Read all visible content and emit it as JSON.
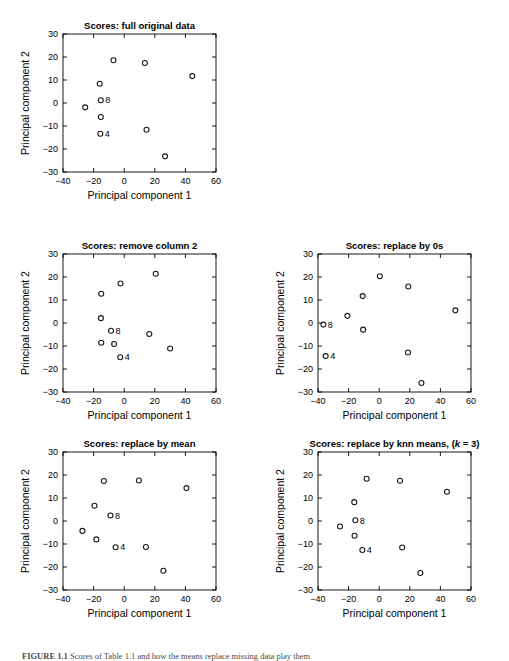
{
  "figure": {
    "background": "#ffffff",
    "marker_color": "#1a1a1a",
    "text_color": "#000000"
  },
  "axis_common": {
    "xlabel": "Principal component 1",
    "ylabel": "Principal component 2",
    "xlim": [
      -40,
      60
    ],
    "ylim": [
      -30,
      30
    ],
    "xticks": [
      -40,
      -20,
      0,
      20,
      40,
      60
    ],
    "yticks": [
      -30,
      -20,
      -10,
      0,
      10,
      20,
      30
    ],
    "xtick_labels": [
      "-40",
      "-20",
      "0",
      "20",
      "40",
      "60"
    ],
    "ytick_labels": [
      "-30",
      "-20",
      "-10",
      "0",
      "10",
      "20",
      "30"
    ],
    "grid": false,
    "legend": "none",
    "marker": "circle-open"
  },
  "caption": {
    "label": "FIGURE 1.1",
    "text": "Scores of Table 1.1 and how the means replace missing data play them"
  },
  "chart_data": [
    {
      "id": "full-original-data",
      "type": "scatter",
      "title": "Scores: full original data",
      "xlabel": "Principal component 1",
      "ylabel": "Principal component 2",
      "xlim": [
        -40,
        60
      ],
      "ylim": [
        -30,
        30
      ],
      "grid": false,
      "legend": "none",
      "points": [
        {
          "x": -25.5,
          "y": -1.9,
          "label": ""
        },
        {
          "x": -16.0,
          "y": 8.4,
          "label": ""
        },
        {
          "x": -15.3,
          "y": 1.2,
          "label": "8"
        },
        {
          "x": -15.3,
          "y": -6.1,
          "label": ""
        },
        {
          "x": -15.6,
          "y": -13.4,
          "label": "4"
        },
        {
          "x": -7.0,
          "y": 18.6,
          "label": ""
        },
        {
          "x": 13.5,
          "y": 17.4,
          "label": ""
        },
        {
          "x": 14.6,
          "y": -11.6,
          "label": ""
        },
        {
          "x": 26.7,
          "y": -23.2,
          "label": ""
        },
        {
          "x": 44.5,
          "y": 11.7,
          "label": ""
        }
      ]
    },
    {
      "id": "remove-column-2",
      "type": "scatter",
      "title": "Scores: remove column 2",
      "xlabel": "Principal component 1",
      "ylabel": "Principal component 2",
      "xlim": [
        -40,
        60
      ],
      "ylim": [
        -30,
        30
      ],
      "grid": false,
      "legend": "none",
      "points": [
        {
          "x": -15.0,
          "y": 12.7,
          "label": ""
        },
        {
          "x": -15.2,
          "y": 2.1,
          "label": ""
        },
        {
          "x": -15.0,
          "y": -8.6,
          "label": ""
        },
        {
          "x": -8.6,
          "y": -3.4,
          "label": "8"
        },
        {
          "x": -6.6,
          "y": -9.1,
          "label": ""
        },
        {
          "x": -2.4,
          "y": 17.2,
          "label": ""
        },
        {
          "x": -2.6,
          "y": -14.9,
          "label": "4"
        },
        {
          "x": 16.4,
          "y": -4.8,
          "label": ""
        },
        {
          "x": 20.6,
          "y": 21.4,
          "label": ""
        },
        {
          "x": 30.0,
          "y": -11.1,
          "label": ""
        }
      ]
    },
    {
      "id": "replace-by-0s",
      "type": "scatter",
      "title": "Scores: replace by 0s",
      "xlabel": "Principal component 1",
      "ylabel": "Principal component 2",
      "xlim": [
        -40,
        60
      ],
      "ylim": [
        -30,
        30
      ],
      "grid": false,
      "legend": "none",
      "points": [
        {
          "x": -36.5,
          "y": -0.7,
          "label": "8"
        },
        {
          "x": -35.0,
          "y": -14.4,
          "label": "4"
        },
        {
          "x": -20.8,
          "y": 3.1,
          "label": ""
        },
        {
          "x": -10.8,
          "y": 11.7,
          "label": ""
        },
        {
          "x": -10.5,
          "y": -2.9,
          "label": ""
        },
        {
          "x": 0.4,
          "y": 20.3,
          "label": ""
        },
        {
          "x": 19.0,
          "y": 15.9,
          "label": ""
        },
        {
          "x": 18.8,
          "y": -12.8,
          "label": ""
        },
        {
          "x": 27.6,
          "y": -26.1,
          "label": ""
        },
        {
          "x": 49.8,
          "y": 5.5,
          "label": ""
        }
      ]
    },
    {
      "id": "replace-by-mean",
      "type": "scatter",
      "title": "Scores: replace by mean",
      "xlabel": "Principal component 1",
      "ylabel": "Principal component 2",
      "xlim": [
        -40,
        60
      ],
      "ylim": [
        -30,
        30
      ],
      "grid": false,
      "legend": "none",
      "points": [
        {
          "x": -27.3,
          "y": -4.3,
          "label": ""
        },
        {
          "x": -19.4,
          "y": 6.6,
          "label": ""
        },
        {
          "x": -18.2,
          "y": -8.0,
          "label": ""
        },
        {
          "x": -13.3,
          "y": 17.4,
          "label": ""
        },
        {
          "x": -9.0,
          "y": 2.4,
          "label": "8"
        },
        {
          "x": -5.6,
          "y": -11.4,
          "label": "4"
        },
        {
          "x": 9.6,
          "y": 17.6,
          "label": ""
        },
        {
          "x": 14.2,
          "y": -11.3,
          "label": ""
        },
        {
          "x": 25.6,
          "y": -21.6,
          "label": ""
        },
        {
          "x": 40.7,
          "y": 14.3,
          "label": ""
        }
      ]
    },
    {
      "id": "replace-by-knn-means",
      "type": "scatter",
      "title_prefix": "Scores: replace by knn means, (",
      "title_italic": "k",
      "title_suffix": " = 3)",
      "title": "Scores: replace by knn means, (k = 3)",
      "xlabel": "Principal component 1",
      "ylabel": "Principal component 2",
      "xlim": [
        -40,
        60
      ],
      "ylim": [
        -30,
        30
      ],
      "grid": false,
      "legend": "none",
      "points": [
        {
          "x": -25.6,
          "y": -2.4,
          "label": ""
        },
        {
          "x": -16.3,
          "y": 8.2,
          "label": ""
        },
        {
          "x": -15.6,
          "y": 0.3,
          "label": "8"
        },
        {
          "x": -16.1,
          "y": -6.4,
          "label": ""
        },
        {
          "x": -11.0,
          "y": -12.6,
          "label": "4"
        },
        {
          "x": -8.2,
          "y": 18.4,
          "label": ""
        },
        {
          "x": 13.6,
          "y": 17.5,
          "label": ""
        },
        {
          "x": 15.0,
          "y": -11.5,
          "label": ""
        },
        {
          "x": 26.9,
          "y": -22.6,
          "label": ""
        },
        {
          "x": 44.3,
          "y": 12.7,
          "label": ""
        }
      ]
    }
  ]
}
